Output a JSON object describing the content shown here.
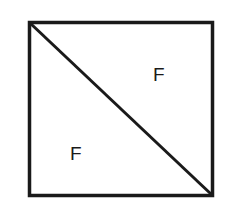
{
  "diagram": {
    "shape": "square",
    "divider": "diagonal from top-left to bottom-right",
    "stroke_color": "#1a1a1a",
    "background": "#ffffff",
    "labels": [
      {
        "region": "upper-right-triangle",
        "text": "F"
      },
      {
        "region": "lower-left-triangle",
        "text": "F"
      }
    ]
  }
}
